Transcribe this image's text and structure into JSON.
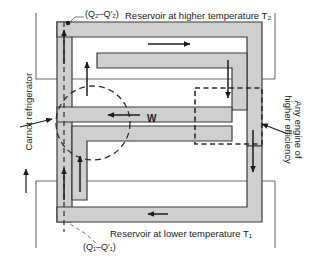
{
  "figure": {
    "type": "thermodynamics-diagram",
    "colors": {
      "band_fill": "#cfcfcf",
      "band_stroke": "#3a3a3a",
      "reservoir_line": "#6e6e6e",
      "arrow": "#1c1c1c",
      "dashed": "#2b2b2b",
      "text": "#1c1c1c",
      "background": "#ffffff"
    },
    "labels": {
      "top_reservoir": "Reservoir at higher temperature T₂",
      "bottom_reservoir": "Reservoir at lower temperature T₁",
      "heat_top": "(Q₂–Q′₂)",
      "heat_bottom": "(Q₁–Q′₁)",
      "work": "W",
      "carnot": "Carnot refrigerator",
      "engine_line1": "Any engine of",
      "engine_line2": "higher efficiency"
    },
    "arrows": [
      {
        "name": "top-right-arrow",
        "direction": "right",
        "region": "upper-band"
      },
      {
        "name": "left-outer-up-arrow",
        "direction": "up",
        "region": "left-column"
      },
      {
        "name": "left-inner-up-arrow",
        "direction": "up",
        "region": "left-column"
      },
      {
        "name": "work-arrow",
        "direction": "left",
        "region": "middle-band"
      },
      {
        "name": "right-upper-down-arrow",
        "direction": "down",
        "region": "right-column"
      },
      {
        "name": "right-lower-down-arrow",
        "direction": "down",
        "region": "right-column"
      },
      {
        "name": "bottom-left-up-arrow",
        "direction": "up",
        "region": "left-column"
      },
      {
        "name": "bottom-inner-up-arrow",
        "direction": "up",
        "region": "left-column"
      },
      {
        "name": "bottom-band-left-arrow",
        "direction": "left",
        "region": "lower-band"
      },
      {
        "name": "carnot-leader-arrow",
        "direction": "up-right",
        "region": "left-label"
      }
    ],
    "annotations": {
      "carnot_marker": "dashed-circle",
      "engine_marker": "dashed-rectangle"
    }
  }
}
